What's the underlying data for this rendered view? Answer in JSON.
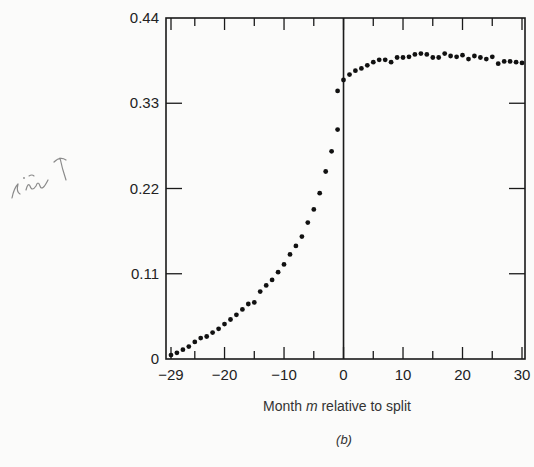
{
  "chart_data": {
    "type": "scatter",
    "title": "",
    "panel_label": "(b)",
    "xlabel": "Month m relative to split",
    "xlabel_parts": {
      "before": "Month ",
      "italic": "m",
      "after": " relative to split"
    },
    "ylabel": "",
    "xlim": [
      -29,
      31
    ],
    "ylim": [
      0,
      0.44
    ],
    "x_ticks": [
      -29,
      -20,
      -10,
      0,
      10,
      20,
      30
    ],
    "x_tick_labels": [
      "−29",
      "−20",
      "−10",
      "0",
      "10",
      "20",
      "30"
    ],
    "y_ticks": [
      0,
      0.11,
      0.22,
      0.33,
      0.44
    ],
    "y_tick_labels": [
      "0",
      "0.11",
      "0.22",
      "0.33",
      "0.44"
    ],
    "vertical_reference_line_at_x": 0,
    "grid": false,
    "legend": null,
    "series": [
      {
        "name": "before split",
        "x": [
          -29,
          -28,
          -27,
          -26,
          -25,
          -24,
          -23,
          -22,
          -21,
          -20,
          -19,
          -18,
          -17,
          -16,
          -15,
          -14,
          -13,
          -12,
          -11,
          -10,
          -9,
          -8,
          -7,
          -6,
          -5,
          -4,
          -3,
          -2,
          -1
        ],
        "y": [
          0.005,
          0.008,
          0.012,
          0.016,
          0.022,
          0.027,
          0.029,
          0.034,
          0.039,
          0.045,
          0.051,
          0.057,
          0.064,
          0.071,
          0.073,
          0.087,
          0.095,
          0.102,
          0.112,
          0.122,
          0.135,
          0.146,
          0.158,
          0.176,
          0.193,
          0.214,
          0.242,
          0.268,
          0.296
        ]
      },
      {
        "name": "near split",
        "x": [
          -1,
          0
        ],
        "y": [
          0.346,
          0.36
        ]
      },
      {
        "name": "after split",
        "x": [
          1,
          2,
          3,
          4,
          5,
          6,
          7,
          8,
          9,
          10,
          11,
          12,
          13,
          14,
          15,
          16,
          17,
          18,
          19,
          20,
          21,
          22,
          23,
          24,
          25,
          26,
          27,
          28,
          29,
          30
        ],
        "y": [
          0.367,
          0.372,
          0.375,
          0.379,
          0.383,
          0.386,
          0.386,
          0.383,
          0.389,
          0.389,
          0.39,
          0.393,
          0.394,
          0.393,
          0.389,
          0.389,
          0.394,
          0.391,
          0.39,
          0.392,
          0.387,
          0.391,
          0.389,
          0.387,
          0.39,
          0.381,
          0.384,
          0.384,
          0.383,
          0.382
        ]
      }
    ]
  },
  "annotations": {
    "handwritten_note": "div ↑"
  }
}
